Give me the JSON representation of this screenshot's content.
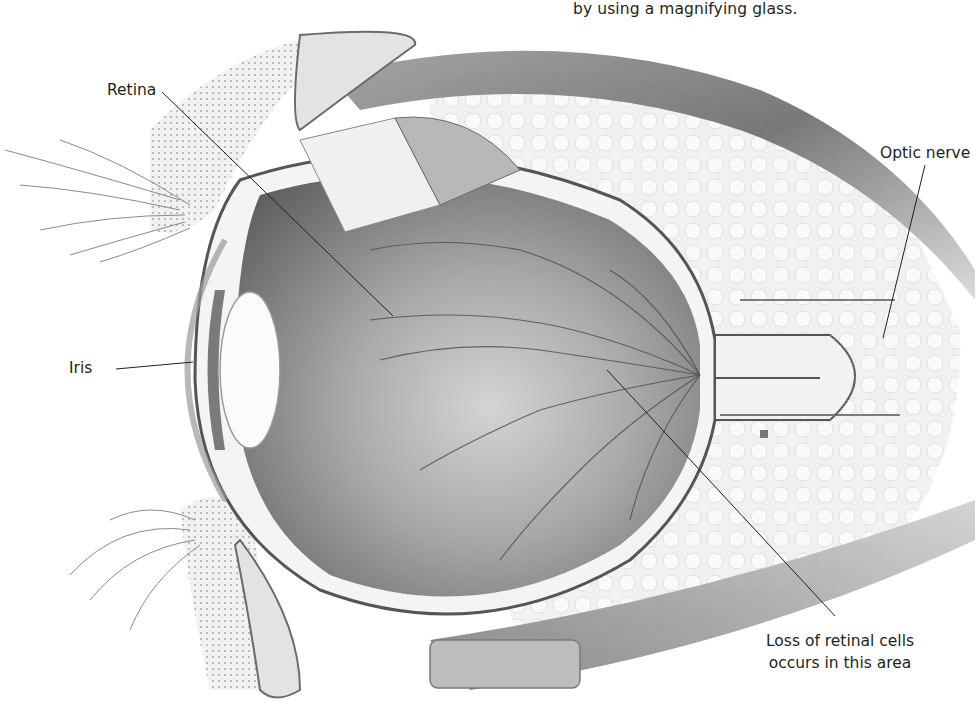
{
  "figure": {
    "caption_fragment": "by using a magnifying glass.",
    "labels": {
      "retina": "Retina",
      "optic_nerve": "Optic nerve",
      "iris": "Iris",
      "loss_line1": "Loss of retinal cells",
      "loss_line2": "occurs in this area"
    },
    "colors": {
      "background": "#ffffff",
      "ink": "#231f20",
      "vitreous_dark": "#6e6e6e",
      "vitreous_light": "#c9c9c9",
      "tissue_light": "#e8e8e8",
      "muscle": "#8a8a8a"
    }
  }
}
